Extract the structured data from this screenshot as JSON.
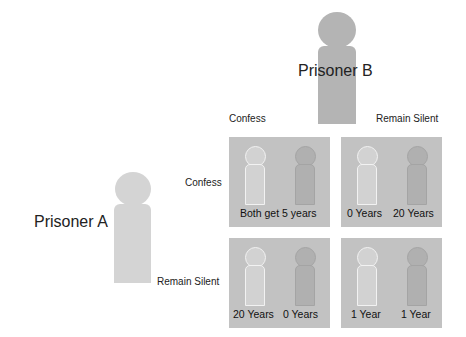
{
  "diagram": {
    "type": "payoff-matrix",
    "topic": "Prisoner's Dilemma"
  },
  "players": {
    "a": {
      "label": "Prisoner A",
      "color": "#d4d4d4"
    },
    "b": {
      "label": "Prisoner B",
      "color": "#b4b4b4"
    }
  },
  "columns": [
    {
      "label": "Confess"
    },
    {
      "label": "Remain Silent"
    }
  ],
  "rows": [
    {
      "label": "Confess"
    },
    {
      "label": "Remain Silent"
    }
  ],
  "cells": {
    "confess_confess": {
      "label": "Both get 5 years"
    },
    "confess_silent": {
      "a_label": "0 Years",
      "b_label": "20 Years"
    },
    "silent_confess": {
      "a_label": "20 Years",
      "b_label": "0 Years"
    },
    "silent_silent": {
      "a_label": "1 Year",
      "b_label": "1 Year"
    }
  },
  "colors": {
    "panel": "#c2c2c2",
    "figure_a": "#d2d2d2",
    "figure_b": "#b0b0b0"
  }
}
